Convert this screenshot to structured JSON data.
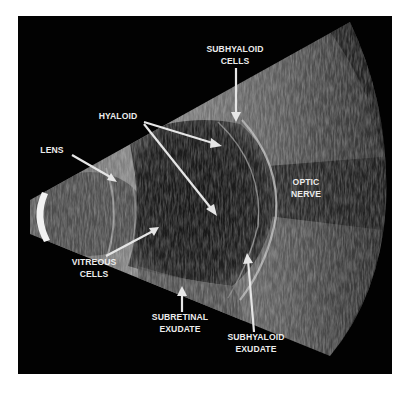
{
  "figure": {
    "type": "ocular B-scan ultrasound",
    "colors": {
      "background": "#ffffff",
      "panel": "#020202",
      "label": "#ececec",
      "arrow": "#e6e6e6"
    },
    "labels": [
      {
        "id": "subhyaloid-cells",
        "lines": [
          "SUBHYALOID",
          "CELLS"
        ]
      },
      {
        "id": "hyaloid",
        "lines": [
          "HYALOID"
        ]
      },
      {
        "id": "lens",
        "lines": [
          "LENS"
        ]
      },
      {
        "id": "optic-nerve",
        "lines": [
          "OPTIC",
          "NERVE"
        ]
      },
      {
        "id": "vitreous-cells",
        "lines": [
          "VITREOUS",
          "CELLS"
        ]
      },
      {
        "id": "subretinal-exudate",
        "lines": [
          "SUBRETINAL",
          "EXUDATE"
        ]
      },
      {
        "id": "subhyaloid-exudate",
        "lines": [
          "SUBHYALOID",
          "EXUDATE"
        ]
      }
    ]
  }
}
